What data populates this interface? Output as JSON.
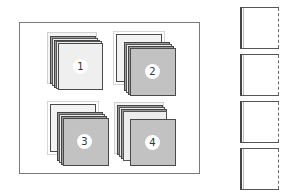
{
  "diagram": {
    "frame": {
      "label": ""
    },
    "stacks": [
      {
        "id": 1,
        "label": "1",
        "front_color": "#efefef",
        "variant": "light-front"
      },
      {
        "id": 2,
        "label": "2",
        "front_color": "#c2c2c2",
        "variant": "gray-front"
      },
      {
        "id": 3,
        "label": "3",
        "front_color": "#c2c2c2",
        "variant": "gray-front"
      },
      {
        "id": 4,
        "label": "4",
        "front_color": "#c2c2c2",
        "variant": "gray-front-offset"
      }
    ],
    "side_pages": [
      {
        "index": 1
      },
      {
        "index": 2
      },
      {
        "index": 3
      },
      {
        "index": 4
      }
    ],
    "colors": {
      "frame_border": "#7a7a7a",
      "gray_sheet": "#c2c2c2",
      "light_sheet": "#efefef",
      "badge": "#ffffff"
    }
  }
}
